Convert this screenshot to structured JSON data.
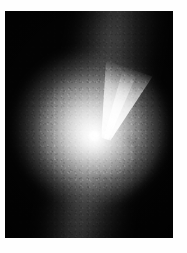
{
  "image": {
    "kind": "astronomical-photograph",
    "subject": "elliptical galaxy with relativistic jet",
    "colorspace": "grayscale",
    "background_color": "#ffffff",
    "plate_color": "#030303",
    "caption": ""
  },
  "frame": {
    "width_px": 187,
    "height_px": 253,
    "plate_left_px": 5,
    "plate_top_px": 11,
    "plate_width_px": 168,
    "plate_height_px": 227
  },
  "features": [
    {
      "name": "nucleus",
      "label": "bright unresolved nucleus",
      "center_x_px": 89,
      "center_y_px": 125,
      "peak_brightness": 255
    },
    {
      "name": "jet",
      "label": "relativistic jet cone",
      "origin_x_px": 89,
      "origin_y_px": 125,
      "tip_x_px": 117,
      "tip_y_px": 63,
      "position_angle_deg": 19,
      "opening_angle_deg": 28,
      "brightness": 240
    },
    {
      "name": "stellar-halo",
      "label": "elliptical stellar halo",
      "center_x_px": 91,
      "center_y_px": 128,
      "semi_major_px": 74,
      "semi_minor_px": 62,
      "position_angle_deg": -12,
      "brightness": 190
    },
    {
      "name": "dust-arc",
      "label": "dark dust arc",
      "center_x_px": 107,
      "center_y_px": 149,
      "brightness": 60
    },
    {
      "name": "diagonal-plume",
      "label": "faint diagonal plume",
      "position_angle_deg": 104,
      "brightness": 95
    },
    {
      "name": "lower-tail",
      "label": "faint southern tail",
      "top_x_px": 80,
      "top_y_px": 160,
      "bottom_x_px": 72,
      "bottom_y_px": 238,
      "brightness": 80
    }
  ],
  "palette": {
    "black": "#030303",
    "core_white": "#ffffff",
    "halo_gray": "#bababa",
    "plume_gray": "#767676",
    "paper_white": "#fefefe"
  }
}
